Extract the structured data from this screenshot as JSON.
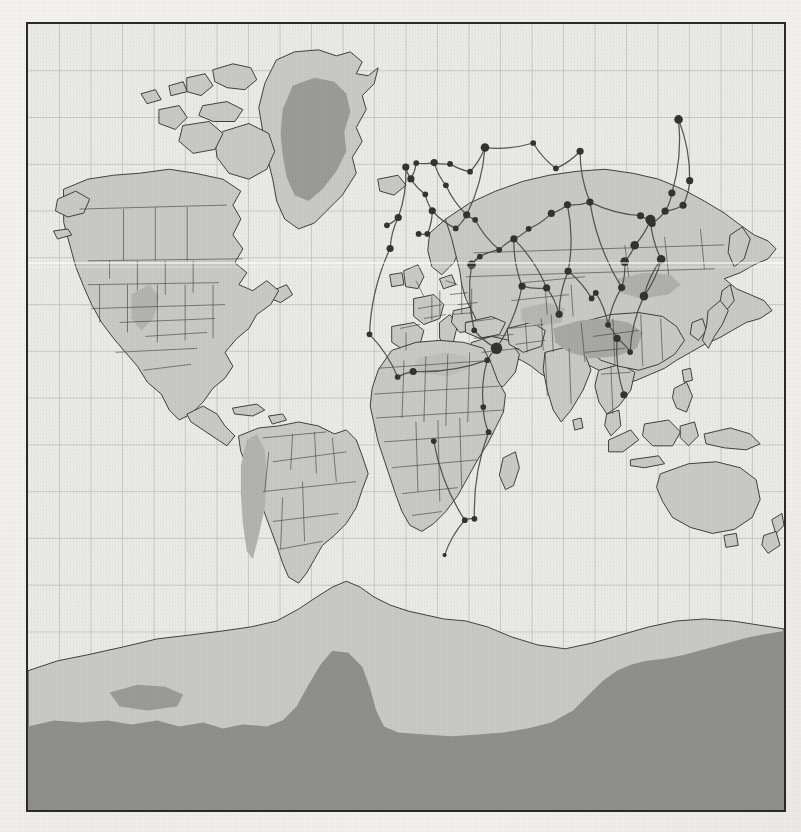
{
  "document": {
    "kind": "printed-world-map",
    "title": "",
    "projection": "equirectangular",
    "has_visible_text": false
  },
  "palette": {
    "paper": "#f1f0ee",
    "ocean": "#eeeeec",
    "land": "#c9c9c6",
    "land_stroke": "#2e2e2e",
    "border_stroke": "#3a3a3a",
    "ice_sheet": "#9b9b98",
    "plateau": "#a8a8a4",
    "antarctic_ice": "#8f8f8c",
    "graticule": "#b9b9b6",
    "frame": "#2a2a2a",
    "route_line": "#4a4a4a",
    "node_fill": "#333333"
  },
  "frame": {
    "x": 26,
    "y": 22,
    "width": 760,
    "height": 790,
    "border_px": 2
  },
  "graticule": {
    "visible": true,
    "meridian_step_deg": 15,
    "parallel_step_deg": 15,
    "meridian_count": 24,
    "parallel_count": 16,
    "stroke": "#b9b9b6"
  },
  "legend": {
    "visible": false,
    "items": []
  },
  "layers": [
    {
      "name": "ocean",
      "label": "Ocean",
      "color": "#eeeeec",
      "visible": true
    },
    {
      "name": "landmass",
      "label": "Landmass",
      "color": "#c9c9c6",
      "visible": true
    },
    {
      "name": "country-borders",
      "label": "Country borders",
      "color": "#3a3a3a",
      "visible": true
    },
    {
      "name": "ice-sheet",
      "label": "Ice sheet",
      "color": "#9b9b98",
      "visible": true
    },
    {
      "name": "highland-plateau",
      "label": "Highland / plateau",
      "color": "#a8a8a4",
      "visible": true
    },
    {
      "name": "corridor-network",
      "label": "Corridor network",
      "color": "#4a4a4a",
      "visible": true
    },
    {
      "name": "network-nodes",
      "label": "Network nodes",
      "color": "#333333",
      "visible": true
    },
    {
      "name": "graticule",
      "label": "Graticule",
      "color": "#b9b9b6",
      "visible": true
    }
  ],
  "chart_data": {
    "type": "map",
    "title": "",
    "xlabel": "Longitude",
    "ylabel": "Latitude",
    "xlim": [
      -180,
      180
    ],
    "ylim": [
      -90,
      83
    ],
    "grid": true,
    "network_summary": {
      "node_count": 64,
      "edge_count": 70,
      "regions_covered": [
        "Europe",
        "North Africa",
        "Sub-Saharan Africa",
        "Middle East",
        "Central Asia",
        "South Asia",
        "East Asia",
        "Southeast Asia",
        "Russia"
      ],
      "regions_without_nodes": [
        "North America",
        "South America",
        "Australia",
        "Antarctica"
      ]
    },
    "nodes": [
      {
        "id": "n01",
        "lon": -9.1,
        "lat": 38.7,
        "size": 4
      },
      {
        "id": "n02",
        "lon": -3.7,
        "lat": 40.4,
        "size": 5
      },
      {
        "id": "n03",
        "lon": 2.3,
        "lat": 48.9,
        "size": 5
      },
      {
        "id": "n04",
        "lon": 4.9,
        "lat": 52.4,
        "size": 4
      },
      {
        "id": "n05",
        "lon": -0.1,
        "lat": 51.5,
        "size": 5
      },
      {
        "id": "n06",
        "lon": 13.4,
        "lat": 52.5,
        "size": 5
      },
      {
        "id": "n07",
        "lon": 12.5,
        "lat": 41.9,
        "size": 5
      },
      {
        "id": "n08",
        "lon": 9.2,
        "lat": 45.5,
        "size": 4
      },
      {
        "id": "n09",
        "lon": 19.0,
        "lat": 47.5,
        "size": 4
      },
      {
        "id": "n10",
        "lon": 21.0,
        "lat": 52.2,
        "size": 4
      },
      {
        "id": "n11",
        "lon": 30.5,
        "lat": 50.5,
        "size": 4
      },
      {
        "id": "n12",
        "lon": 37.6,
        "lat": 55.8,
        "size": 6
      },
      {
        "id": "n13",
        "lon": 28.9,
        "lat": 41.0,
        "size": 5
      },
      {
        "id": "n14",
        "lon": 23.7,
        "lat": 38.0,
        "size": 4
      },
      {
        "id": "n15",
        "lon": 32.9,
        "lat": 39.9,
        "size": 4
      },
      {
        "id": "n16",
        "lon": 35.2,
        "lat": 31.8,
        "size": 4
      },
      {
        "id": "n17",
        "lon": 31.2,
        "lat": 30.0,
        "size": 6
      },
      {
        "id": "n18",
        "lon": 32.5,
        "lat": 15.6,
        "size": 4
      },
      {
        "id": "n19",
        "lon": 43.1,
        "lat": 11.6,
        "size": 8
      },
      {
        "id": "n20",
        "lon": 38.7,
        "lat": 9.0,
        "size": 4
      },
      {
        "id": "n21",
        "lon": 36.8,
        "lat": -1.3,
        "size": 4
      },
      {
        "id": "n22",
        "lon": 39.3,
        "lat": -6.8,
        "size": 4
      },
      {
        "id": "n23",
        "lon": 32.6,
        "lat": -25.9,
        "size": 4
      },
      {
        "id": "n24",
        "lon": 28.0,
        "lat": -26.2,
        "size": 4
      },
      {
        "id": "n25",
        "lon": 18.4,
        "lat": -33.9,
        "size": 3
      },
      {
        "id": "n26",
        "lon": 13.2,
        "lat": -8.8,
        "size": 4
      },
      {
        "id": "n27",
        "lon": 3.4,
        "lat": 6.5,
        "size": 5
      },
      {
        "id": "n28",
        "lon": -4.0,
        "lat": 5.3,
        "size": 4
      },
      {
        "id": "n29",
        "lon": -17.4,
        "lat": 14.7,
        "size": 4
      },
      {
        "id": "n30",
        "lon": 6.0,
        "lat": 36.8,
        "size": 4
      },
      {
        "id": "n31",
        "lon": -7.6,
        "lat": 33.6,
        "size": 5
      },
      {
        "id": "n32",
        "lon": 10.2,
        "lat": 36.8,
        "size": 4
      },
      {
        "id": "n33",
        "lon": 44.4,
        "lat": 33.3,
        "size": 4
      },
      {
        "id": "n34",
        "lon": 51.4,
        "lat": 35.7,
        "size": 5
      },
      {
        "id": "n35",
        "lon": 55.3,
        "lat": 25.3,
        "size": 5
      },
      {
        "id": "n36",
        "lon": 58.4,
        "lat": 37.9,
        "size": 4
      },
      {
        "id": "n37",
        "lon": 69.2,
        "lat": 41.3,
        "size": 5
      },
      {
        "id": "n38",
        "lon": 76.9,
        "lat": 43.2,
        "size": 5
      },
      {
        "id": "n39",
        "lon": 71.4,
        "lat": 51.2,
        "size": 4
      },
      {
        "id": "n40",
        "lon": 60.6,
        "lat": 56.8,
        "size": 4
      },
      {
        "id": "n41",
        "lon": 82.9,
        "lat": 55.0,
        "size": 5
      },
      {
        "id": "n42",
        "lon": 87.6,
        "lat": 43.8,
        "size": 5
      },
      {
        "id": "n43",
        "lon": 67.0,
        "lat": 24.9,
        "size": 5
      },
      {
        "id": "n44",
        "lon": 72.9,
        "lat": 19.1,
        "size": 5
      },
      {
        "id": "n45",
        "lon": 77.2,
        "lat": 28.6,
        "size": 5
      },
      {
        "id": "n46",
        "lon": 88.4,
        "lat": 22.6,
        "size": 4
      },
      {
        "id": "n47",
        "lon": 90.4,
        "lat": 23.8,
        "size": 4
      },
      {
        "id": "n48",
        "lon": 96.2,
        "lat": 16.8,
        "size": 4
      },
      {
        "id": "n49",
        "lon": 100.5,
        "lat": 13.8,
        "size": 5
      },
      {
        "id": "n50",
        "lon": 103.8,
        "lat": 1.4,
        "size": 5
      },
      {
        "id": "n51",
        "lon": 106.7,
        "lat": 10.8,
        "size": 4
      },
      {
        "id": "n52",
        "lon": 102.7,
        "lat": 25.0,
        "size": 5
      },
      {
        "id": "n53",
        "lon": 104.1,
        "lat": 30.7,
        "size": 6
      },
      {
        "id": "n54",
        "lon": 108.9,
        "lat": 34.3,
        "size": 6
      },
      {
        "id": "n55",
        "lon": 113.3,
        "lat": 23.1,
        "size": 6
      },
      {
        "id": "n56",
        "lon": 121.5,
        "lat": 31.2,
        "size": 6
      },
      {
        "id": "n57",
        "lon": 116.4,
        "lat": 39.9,
        "size": 7
      },
      {
        "id": "n58",
        "lon": 117.2,
        "lat": 39.1,
        "size": 5
      },
      {
        "id": "n59",
        "lon": 123.4,
        "lat": 41.8,
        "size": 5
      },
      {
        "id": "n60",
        "lon": 126.6,
        "lat": 45.8,
        "size": 5
      },
      {
        "id": "n61",
        "lon": 131.9,
        "lat": 43.1,
        "size": 5
      },
      {
        "id": "n62",
        "lon": 135.1,
        "lat": 48.5,
        "size": 5
      },
      {
        "id": "n63",
        "lon": 129.8,
        "lat": 62.0,
        "size": 6
      },
      {
        "id": "n64",
        "lon": 111.7,
        "lat": 40.8,
        "size": 5
      }
    ],
    "edges": [
      [
        "n01",
        "n02"
      ],
      [
        "n02",
        "n05"
      ],
      [
        "n02",
        "n31"
      ],
      [
        "n05",
        "n03"
      ],
      [
        "n03",
        "n04"
      ],
      [
        "n04",
        "n06"
      ],
      [
        "n03",
        "n08"
      ],
      [
        "n08",
        "n07"
      ],
      [
        "n06",
        "n10"
      ],
      [
        "n10",
        "n11"
      ],
      [
        "n11",
        "n12"
      ],
      [
        "n06",
        "n09"
      ],
      [
        "n09",
        "n13"
      ],
      [
        "n07",
        "n14"
      ],
      [
        "n14",
        "n13"
      ],
      [
        "n13",
        "n15"
      ],
      [
        "n15",
        "n33"
      ],
      [
        "n16",
        "n17"
      ],
      [
        "n13",
        "n12"
      ],
      [
        "n12",
        "n40"
      ],
      [
        "n40",
        "n39"
      ],
      [
        "n39",
        "n41"
      ],
      [
        "n41",
        "n42"
      ],
      [
        "n42",
        "n64"
      ],
      [
        "n64",
        "n57"
      ],
      [
        "n57",
        "n58"
      ],
      [
        "n58",
        "n59"
      ],
      [
        "n59",
        "n60"
      ],
      [
        "n60",
        "n63"
      ],
      [
        "n59",
        "n61"
      ],
      [
        "n61",
        "n62"
      ],
      [
        "n62",
        "n63"
      ],
      [
        "n57",
        "n56"
      ],
      [
        "n56",
        "n55"
      ],
      [
        "n55",
        "n51"
      ],
      [
        "n51",
        "n49"
      ],
      [
        "n49",
        "n50"
      ],
      [
        "n49",
        "n48"
      ],
      [
        "n48",
        "n47"
      ],
      [
        "n47",
        "n46"
      ],
      [
        "n46",
        "n45"
      ],
      [
        "n45",
        "n44"
      ],
      [
        "n44",
        "n43"
      ],
      [
        "n43",
        "n34"
      ],
      [
        "n34",
        "n33"
      ],
      [
        "n33",
        "n16"
      ],
      [
        "n16",
        "n17"
      ],
      [
        "n17",
        "n18"
      ],
      [
        "n18",
        "n19"
      ],
      [
        "n19",
        "n20"
      ],
      [
        "n20",
        "n21"
      ],
      [
        "n21",
        "n22"
      ],
      [
        "n22",
        "n23"
      ],
      [
        "n23",
        "n24"
      ],
      [
        "n24",
        "n25"
      ],
      [
        "n26",
        "n24"
      ],
      [
        "n27",
        "n28"
      ],
      [
        "n28",
        "n29"
      ],
      [
        "n27",
        "n20"
      ],
      [
        "n30",
        "n32"
      ],
      [
        "n32",
        "n07"
      ],
      [
        "n31",
        "n29"
      ],
      [
        "n34",
        "n36"
      ],
      [
        "n36",
        "n37"
      ],
      [
        "n37",
        "n38"
      ],
      [
        "n38",
        "n42"
      ],
      [
        "n42",
        "n52"
      ],
      [
        "n52",
        "n53"
      ],
      [
        "n53",
        "n54"
      ],
      [
        "n54",
        "n57"
      ],
      [
        "n55",
        "n56"
      ],
      [
        "n35",
        "n43"
      ],
      [
        "n34",
        "n35"
      ],
      [
        "n19",
        "n35"
      ],
      [
        "n45",
        "n38"
      ],
      [
        "n52",
        "n48"
      ]
    ]
  }
}
